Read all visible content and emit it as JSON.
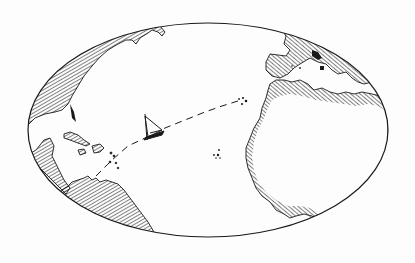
{
  "illustration": {
    "title": "",
    "subject": "Hand-drawn map of the Atlantic Ocean with a sailing ship and dashed voyage route",
    "colors": {
      "ink": "#1a1a1a",
      "paper": "#fdfdfd"
    },
    "elements": [
      "oval-map-frame",
      "north-america-coast",
      "caribbean-islands",
      "south-america-coast",
      "europe-coast",
      "africa-coast",
      "canary-islands",
      "cape-verde-islands",
      "sailing-ship",
      "voyage-route"
    ]
  }
}
